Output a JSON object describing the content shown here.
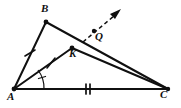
{
  "figure": {
    "kind": "geometry-diagram",
    "background_color": "#ffffff",
    "stroke_color": "#101010",
    "labels": {
      "B": "B",
      "Q": "Q",
      "K": "K",
      "A": "A",
      "C": "C"
    },
    "points": {
      "A": {
        "x": 14,
        "y": 89
      },
      "B": {
        "x": 46,
        "y": 22
      },
      "C": {
        "x": 168,
        "y": 89
      },
      "K": {
        "x": 72,
        "y": 48
      },
      "Q": {
        "x": 94,
        "y": 31
      }
    },
    "segments": [
      {
        "name": "side-AB",
        "from": "A",
        "to": "B",
        "style": "solid",
        "ticks": 1
      },
      {
        "name": "side-BC",
        "from": "B",
        "to": "C",
        "style": "solid",
        "ticks": 0
      },
      {
        "name": "side-AC",
        "from": "A",
        "to": "C",
        "style": "solid",
        "ticks": 2
      },
      {
        "name": "segment-AK",
        "from": "A",
        "to": "K",
        "style": "solid",
        "ticks": 1
      },
      {
        "name": "segment-KC",
        "from": "K",
        "to": "C",
        "style": "solid",
        "ticks": 0
      }
    ],
    "rays": [
      {
        "name": "dashed-ray-through-Q",
        "style": "dashed",
        "arrow": true,
        "from_x": 83,
        "from_y": 42,
        "to_x": 120,
        "to_y": 11
      }
    ],
    "angle_marks": [
      {
        "name": "angle-arc-at-A",
        "vertex": "A",
        "ticks": 1
      }
    ],
    "dots": [
      {
        "name": "point-K-dot",
        "x": 72,
        "y": 48
      },
      {
        "name": "point-Q-dot",
        "x": 94,
        "y": 31
      }
    ]
  }
}
